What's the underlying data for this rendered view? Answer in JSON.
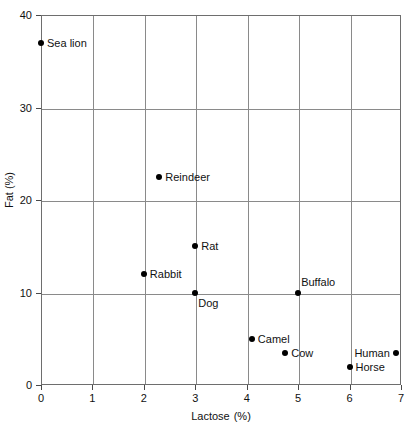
{
  "chart_data": {
    "type": "scatter",
    "title": "",
    "xlabel": "Lactose",
    "xunit": "(%)",
    "ylabel": "Fat (%)",
    "xlim": [
      0,
      7
    ],
    "ylim": [
      0,
      40
    ],
    "xticks": [
      "0",
      "1",
      "2",
      "3",
      "4",
      "5",
      "6",
      "7"
    ],
    "yticks": [
      "0",
      "10",
      "20",
      "30",
      "40"
    ],
    "grid": true,
    "legend": "none",
    "marker_color": "#000000",
    "grid_color": "#8a8a8a",
    "points": [
      {
        "label": "Sea lion",
        "x": 0.0,
        "y": 37.0,
        "label_pos": "right"
      },
      {
        "label": "Reindeer",
        "x": 2.3,
        "y": 22.5,
        "label_pos": "right"
      },
      {
        "label": "Rat",
        "x": 3.0,
        "y": 15.0,
        "label_pos": "right"
      },
      {
        "label": "Rabbit",
        "x": 2.0,
        "y": 12.0,
        "label_pos": "right"
      },
      {
        "label": "Dog",
        "x": 3.0,
        "y": 10.0,
        "label_pos": "below"
      },
      {
        "label": "Buffalo",
        "x": 5.0,
        "y": 10.0,
        "label_pos": "above"
      },
      {
        "label": "Camel",
        "x": 4.1,
        "y": 5.0,
        "label_pos": "right"
      },
      {
        "label": "Cow",
        "x": 4.75,
        "y": 3.5,
        "label_pos": "right"
      },
      {
        "label": "Horse",
        "x": 6.0,
        "y": 2.0,
        "label_pos": "right"
      },
      {
        "label": "Human",
        "x": 6.9,
        "y": 3.5,
        "label_pos": "left"
      }
    ]
  }
}
